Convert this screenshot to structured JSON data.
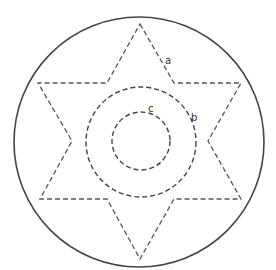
{
  "diagram": {
    "outer_circle": {
      "cx": 139,
      "cy": 142,
      "r": 125,
      "stroke": "#444444",
      "stroke_width": 1.6
    },
    "star": {
      "stroke": "#555555",
      "dash": "5 3",
      "points": "140,24 174,83 241,83 208,141 241,199 174,199 140,259 107,199 40,199 72,141 38,83 107,83"
    },
    "middle_circle": {
      "cx": 141,
      "cy": 142,
      "r": 55,
      "stroke": "#444444",
      "dash": "5 3"
    },
    "inner_circle": {
      "cx": 141,
      "cy": 141,
      "r": 29,
      "stroke": "#444444",
      "dash": "5 3"
    },
    "labels": [
      {
        "id": "a",
        "text": "a",
        "x": 165,
        "y": 64
      },
      {
        "id": "b",
        "text": "b",
        "x": 191,
        "y": 121
      },
      {
        "id": "c",
        "text": "c",
        "x": 148,
        "y": 112
      }
    ]
  }
}
